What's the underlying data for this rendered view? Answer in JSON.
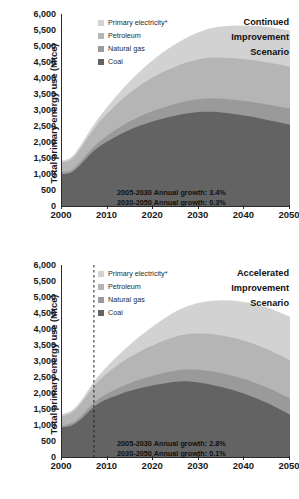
{
  "chart_data": [
    {
      "type": "area",
      "id": "continued-improvement",
      "title": "Continued Improvement Scenario",
      "title_lines": [
        "Continued",
        "Improvement",
        "Scenario"
      ],
      "xlabel": "",
      "ylabel": "Total primary energy use (Mtce)",
      "xlim": [
        2000,
        2050
      ],
      "ylim": [
        0,
        6000
      ],
      "ytick_labels": [
        "0",
        "500",
        "1,000",
        "1,500",
        "2,000",
        "2,500",
        "3,000",
        "3,500",
        "4,000",
        "4,500",
        "5,000",
        "5,500",
        "6,000"
      ],
      "ytick_values": [
        0,
        500,
        1000,
        1500,
        2000,
        2500,
        3000,
        3500,
        4000,
        4500,
        5000,
        5500,
        6000
      ],
      "xtick_labels": [
        "2000",
        "2010",
        "2020",
        "2030",
        "2040",
        "2050"
      ],
      "xtick_values": [
        2000,
        2010,
        2020,
        2030,
        2040,
        2050
      ],
      "grid": false,
      "stacked": true,
      "legend_position": "top-center",
      "annotations": [
        "2005-2030 Annual growth: 3.4%",
        "2030-2050 Annual growth: 0.3%"
      ],
      "x": [
        2000,
        2002,
        2004,
        2006,
        2008,
        2010,
        2012,
        2014,
        2016,
        2018,
        2020,
        2022,
        2024,
        2026,
        2028,
        2030,
        2032,
        2034,
        2036,
        2038,
        2040,
        2042,
        2044,
        2046,
        2048,
        2050
      ],
      "series": [
        {
          "name": "Coal",
          "color": "#636363",
          "values": [
            1000,
            1020,
            1280,
            1600,
            1850,
            2020,
            2180,
            2330,
            2450,
            2560,
            2650,
            2730,
            2800,
            2860,
            2910,
            2940,
            2950,
            2940,
            2910,
            2870,
            2830,
            2780,
            2720,
            2660,
            2600,
            2540
          ]
        },
        {
          "name": "Natural gas",
          "color": "#9a9a9a",
          "values": [
            60,
            70,
            90,
            120,
            150,
            185,
            220,
            250,
            275,
            300,
            320,
            340,
            355,
            370,
            385,
            400,
            415,
            425,
            435,
            445,
            455,
            465,
            475,
            485,
            495,
            505
          ]
        },
        {
          "name": "Petroleum",
          "color": "#b5b5b5",
          "values": [
            300,
            330,
            400,
            500,
            600,
            690,
            780,
            860,
            930,
            1000,
            1060,
            1110,
            1150,
            1190,
            1220,
            1245,
            1265,
            1280,
            1290,
            1300,
            1305,
            1310,
            1315,
            1315,
            1315,
            1310
          ]
        },
        {
          "name": "Primary electricity*",
          "color": "#d2d2d2",
          "values": [
            60,
            70,
            90,
            120,
            160,
            210,
            270,
            330,
            400,
            470,
            540,
            610,
            680,
            740,
            800,
            855,
            905,
            950,
            990,
            1025,
            1055,
            1080,
            1100,
            1115,
            1125,
            1130
          ]
        }
      ]
    },
    {
      "type": "area",
      "id": "accelerated-improvement",
      "title": "Accelerated Improvement Scenario",
      "title_lines": [
        "Accelerated",
        "Improvement",
        "Scenario"
      ],
      "xlabel": "",
      "ylabel": "Total primary energy use (Mtce)",
      "xlim": [
        2000,
        2050
      ],
      "ylim": [
        0,
        6000
      ],
      "ytick_labels": [
        "0",
        "500",
        "1,000",
        "1,500",
        "2,000",
        "2,500",
        "3,000",
        "3,500",
        "4,000",
        "4,500",
        "5,000",
        "5,500",
        "6,000"
      ],
      "ytick_values": [
        0,
        500,
        1000,
        1500,
        2000,
        2500,
        3000,
        3500,
        4000,
        4500,
        5000,
        5500,
        6000
      ],
      "xtick_labels": [
        "2000",
        "2010",
        "2020",
        "2030",
        "2040",
        "2050"
      ],
      "xtick_values": [
        2000,
        2010,
        2020,
        2030,
        2040,
        2050
      ],
      "grid": false,
      "stacked": true,
      "legend_position": "top-center",
      "reference_line": {
        "x": 2007,
        "style": "dashed",
        "color": "#222222"
      },
      "annotations": [
        "2005-2030 Annual growth: 2.8%",
        "2030-2050 Annual growth: 0.1%"
      ],
      "x": [
        2000,
        2002,
        2004,
        2006,
        2008,
        2010,
        2012,
        2014,
        2016,
        2018,
        2020,
        2022,
        2024,
        2026,
        2028,
        2030,
        2032,
        2034,
        2036,
        2038,
        2040,
        2042,
        2044,
        2046,
        2048,
        2050
      ],
      "series": [
        {
          "name": "Coal",
          "color": "#636363",
          "values": [
            930,
            960,
            1150,
            1450,
            1680,
            1820,
            1930,
            2030,
            2110,
            2180,
            2240,
            2290,
            2340,
            2370,
            2360,
            2330,
            2280,
            2220,
            2150,
            2070,
            1980,
            1870,
            1750,
            1620,
            1470,
            1320
          ]
        },
        {
          "name": "Natural gas",
          "color": "#9a9a9a",
          "values": [
            60,
            70,
            90,
            115,
            145,
            175,
            205,
            230,
            255,
            280,
            300,
            320,
            340,
            360,
            380,
            400,
            415,
            430,
            440,
            450,
            460,
            470,
            480,
            490,
            500,
            510
          ]
        },
        {
          "name": "Petroleum",
          "color": "#b5b5b5",
          "values": [
            290,
            320,
            380,
            470,
            560,
            640,
            720,
            790,
            850,
            910,
            960,
            1005,
            1045,
            1080,
            1110,
            1135,
            1155,
            1170,
            1180,
            1190,
            1195,
            1200,
            1200,
            1200,
            1195,
            1190
          ]
        },
        {
          "name": "Primary electricity*",
          "color": "#d2d2d2",
          "values": [
            60,
            70,
            90,
            120,
            160,
            215,
            280,
            350,
            430,
            510,
            590,
            670,
            750,
            825,
            895,
            960,
            1020,
            1075,
            1125,
            1170,
            1210,
            1250,
            1285,
            1315,
            1340,
            1365
          ]
        }
      ]
    }
  ],
  "legend": {
    "items": [
      {
        "label": "Primary electricity*",
        "color": "#d2d2d2"
      },
      {
        "label": "Petroleum",
        "color": "#b5b5b5"
      },
      {
        "label": "Natural gas",
        "color": "#9a9a9a"
      },
      {
        "label": "Coal",
        "color": "#636363"
      }
    ]
  }
}
